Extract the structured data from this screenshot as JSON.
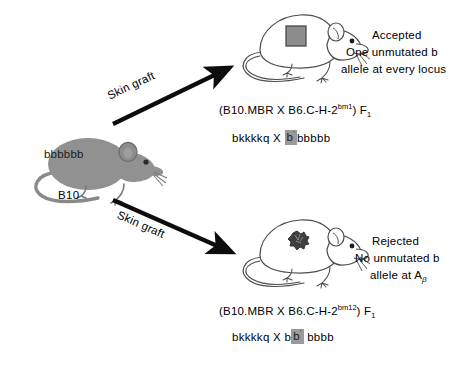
{
  "figure": {
    "background_color": "#ffffff",
    "donor": {
      "label": "B10",
      "genotype": "bbbbbb",
      "mouse_icon": "filled-grey-mouse",
      "body_color": "#919191"
    },
    "arrows": [
      {
        "name": "arrow-to-accepted",
        "label": "Skin graft",
        "direction": "up-right"
      },
      {
        "name": "arrow-to-rejected",
        "label": "Skin graft",
        "direction": "down-right"
      }
    ],
    "branches": [
      {
        "id": "accepted",
        "mouse_icon": "outline-mouse-with-square-graft",
        "graft_patch": "solid-square-graft",
        "graft_color": "#8d8d8d",
        "status": "Accepted",
        "description_line1": "One unmutated b",
        "description_line2": "allele at every locus",
        "strain_prefix": "(B10.MBR X B6.C-H-2",
        "strain_superscript": "bm1",
        "strain_suffix": ") F",
        "strain_subscript": "1",
        "genotype_left": "bkkkkq",
        "genotype_cross": "X",
        "highlight_allele": "b",
        "highlight_superscript": "'",
        "genotype_right": "bbbbb"
      },
      {
        "id": "rejected",
        "mouse_icon": "outline-mouse-with-shrivelled-graft",
        "graft_patch": "scarred-rejected-graft",
        "graft_color": "#4a4a4a",
        "status": "Rejected",
        "description_line1": "No unmutated b",
        "description_line2_prefix": "allele at  A",
        "description_line2_subscript": "β",
        "strain_prefix": "(B10.MBR X B6.C-H-2",
        "strain_superscript": "bm12",
        "strain_suffix": ") F",
        "strain_subscript": "1",
        "genotype_left": "bkkkkq",
        "genotype_cross": "X",
        "genotype_pre_highlight": "b",
        "highlight_allele": "b",
        "highlight_superscript": "'",
        "genotype_right": "bbbb"
      }
    ],
    "colors": {
      "ink": "#000000",
      "mouse_fill": "#919191",
      "mouse_outline": "#555555",
      "highlight_bg": "#9a9a9a"
    }
  }
}
